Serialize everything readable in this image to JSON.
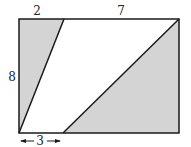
{
  "figure": {
    "type": "rectangle with two shaded triangles",
    "colors": {
      "shade": "#d4d4d4",
      "stroke": "#1a1a1a",
      "background": "#ffffff"
    },
    "labels": {
      "top_left": "2",
      "top_right": "7",
      "left_side": "8",
      "bottom_left": "3"
    },
    "dimensions": {
      "width_total": 9,
      "height": 8,
      "top_left_segment": 2,
      "top_right_segment": 7,
      "bottom_left_segment": 3
    }
  }
}
